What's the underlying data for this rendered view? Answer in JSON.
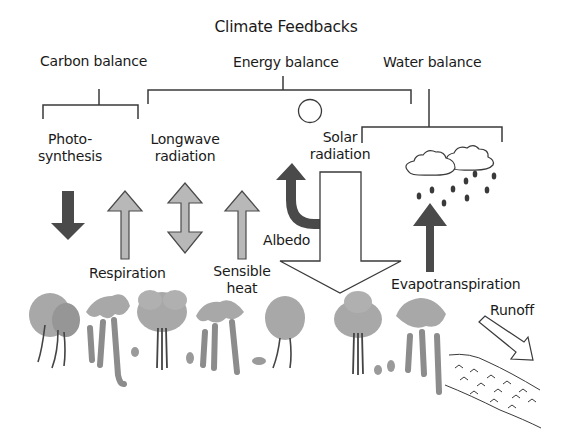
{
  "title": "Climate Feedbacks",
  "categories": {
    "carbon": "Carbon balance",
    "energy": "Energy balance",
    "water": "Water balance"
  },
  "processes": {
    "photosynthesis_line1": "Photo-",
    "photosynthesis_line2": "synthesis",
    "longwave_line1": "Longwave",
    "longwave_line2": "radiation",
    "solar_line1": "Solar",
    "solar_line2": "radiation",
    "respiration": "Respiration",
    "sensible_line1": "Sensible",
    "sensible_line2": "heat",
    "albedo": "Albedo",
    "evapotranspiration": "Evapotranspiration",
    "runoff": "Runoff"
  },
  "colors": {
    "dark_arrow": "#4a4a4a",
    "light_arrow": "#b8b8b8",
    "outline": "#3a3a3a",
    "foliage": "#a8a8a8",
    "trunk": "#6e6e6e"
  }
}
